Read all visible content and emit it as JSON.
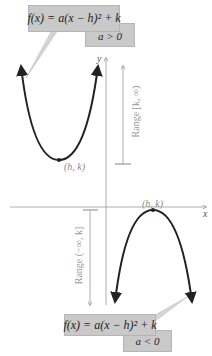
{
  "upper": {
    "equation": "f(x) = a(x − h)² + k",
    "condition": "a > 0",
    "vertex_label": "(h, k)",
    "range_label": "Range [k, ∞)"
  },
  "lower": {
    "equation": "f(x) = a(x − h)² + k",
    "condition": "a < 0",
    "vertex_label": "(h, k)",
    "range_label": "Range (−∞, k]"
  },
  "axes": {
    "x_label": "x",
    "y_label": "y"
  },
  "colors": {
    "curve": "#222222",
    "axis": "#9a9a9a",
    "box_fill": "#c9c9c9",
    "label": "#8a8a8a"
  }
}
